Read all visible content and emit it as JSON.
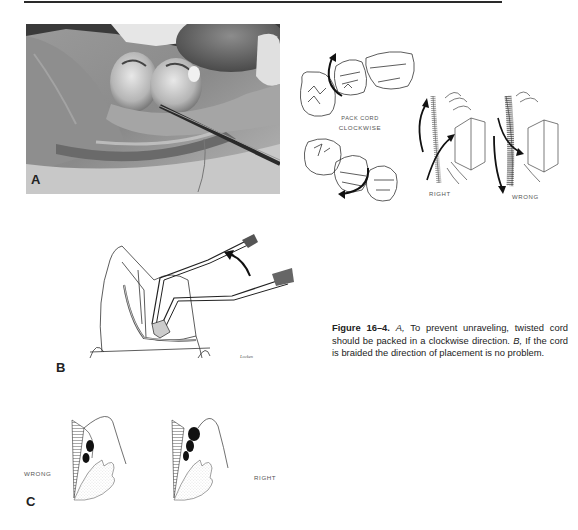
{
  "page": {
    "top_rule": true
  },
  "figure": {
    "panel_a": {
      "letter": "A",
      "photo_description": "intraoral photograph of cord packing around molar"
    },
    "clockwise_diagram": {
      "label_line1": "PACK CORD",
      "label_line2": "CLOCKWISE"
    },
    "twist_diagram": {
      "right_label": "RIGHT",
      "wrong_label": "WRONG"
    },
    "panel_b": {
      "letter": "B",
      "signature": "Locken"
    },
    "panel_c": {
      "letter": "C",
      "wrong_label": "WRONG",
      "right_label": "RIGHT"
    },
    "caption": {
      "figure_number": "Figure 16–4.",
      "part_a_letter": "A,",
      "part_a_text": " To prevent unraveling, twisted cord should be packed in a clockwise direction. ",
      "part_b_letter": "B,",
      "part_b_text": " If the cord is braided the direction of placement is no problem."
    }
  }
}
